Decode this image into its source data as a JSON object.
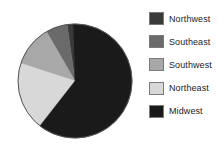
{
  "chart_data": {
    "type": "pie",
    "title": "",
    "subtitle": "",
    "xlabel": "",
    "ylabel": "",
    "grid": false,
    "legend_position": "right",
    "start_angle_deg": -2,
    "direction": "clockwise",
    "categories": [
      "Northwest",
      "Southeast",
      "Southwest",
      "Northeast",
      "Midwest"
    ],
    "values": [
      2,
      6,
      12,
      19,
      61
    ],
    "value_unit": "percent",
    "colors": [
      "#3a3a3a",
      "#6a6a6a",
      "#a8a8a8",
      "#d8d8d8",
      "#1a1a1a"
    ],
    "slices": [
      {
        "label": "Northwest",
        "value": 2,
        "color": "#3a3a3a",
        "start_deg": 352,
        "end_deg": 358
      },
      {
        "label": "Southeast",
        "value": 6,
        "color": "#6a6a6a",
        "start_deg": 330,
        "end_deg": 352
      },
      {
        "label": "Southwest",
        "value": 12,
        "color": "#a8a8a8",
        "start_deg": 288,
        "end_deg": 330
      },
      {
        "label": "Northeast",
        "value": 19,
        "color": "#d8d8d8",
        "start_deg": 218,
        "end_deg": 288
      },
      {
        "label": "Midwest",
        "value": 61,
        "color": "#1a1a1a",
        "start_deg": 358,
        "end_deg": 218
      }
    ],
    "geometry": {
      "center_x": 75,
      "center_y": 81,
      "radius": 57,
      "outline_color": "#555555"
    }
  },
  "legend": {
    "items": [
      {
        "label": "Northwest",
        "color": "#3a3a3a"
      },
      {
        "label": "Southeast",
        "color": "#6a6a6a"
      },
      {
        "label": "Southwest",
        "color": "#a8a8a8"
      },
      {
        "label": "Northeast",
        "color": "#d8d8d8"
      },
      {
        "label": "Midwest",
        "color": "#1a1a1a"
      }
    ]
  },
  "canvas": {
    "background": "#ffffff",
    "width": 219,
    "height": 148
  }
}
